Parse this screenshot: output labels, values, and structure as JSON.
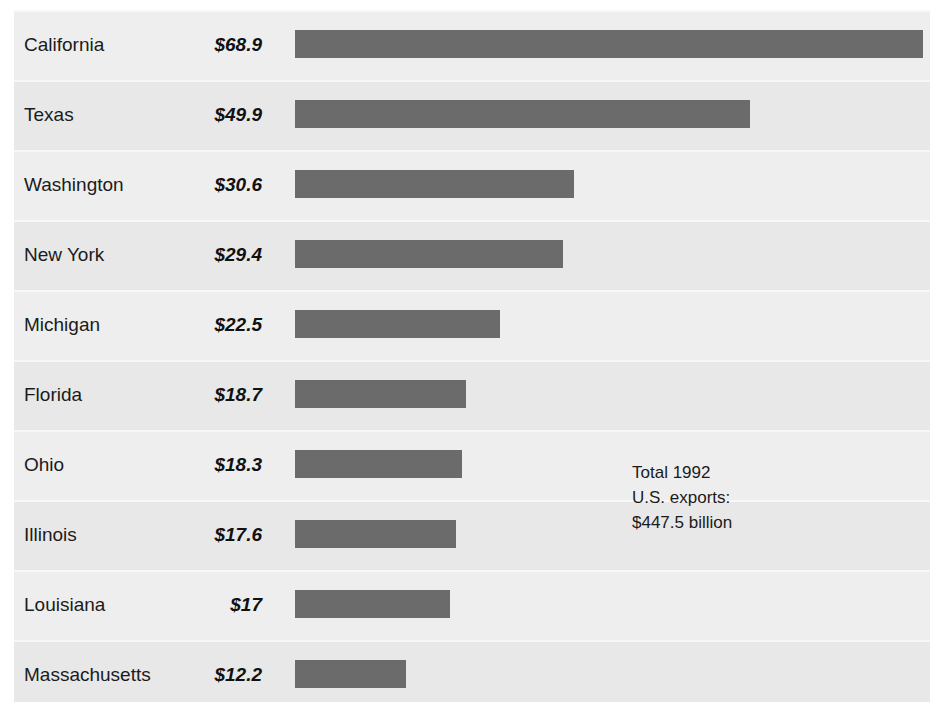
{
  "chart_data": {
    "type": "bar",
    "orientation": "horizontal",
    "title": "",
    "subtitle": "",
    "xlabel": "",
    "ylabel": "",
    "units": "billions of U.S. dollars",
    "grid": false,
    "legend": null,
    "xlim": [
      0,
      68.9
    ],
    "categories": [
      "California",
      "Texas",
      "Washington",
      "New York",
      "Michigan",
      "Florida",
      "Ohio",
      "Illinois",
      "Louisiana",
      "Massachusetts"
    ],
    "values": [
      68.9,
      49.9,
      30.6,
      29.4,
      22.5,
      18.7,
      18.3,
      17.6,
      17,
      12.2
    ],
    "value_labels": [
      "$68.9",
      "$49.9",
      "$30.6",
      "$29.4",
      "$22.5",
      "$18.7",
      "$18.3",
      "$17.6",
      "$17",
      "$12.2"
    ],
    "annotations": [
      {
        "line1": "Total 1992",
        "line2": "U.S. exports:",
        "line3": "$447.5 billion"
      }
    ]
  },
  "rows": [
    {
      "label": "California",
      "value_label": "$68.9",
      "value": 68.9
    },
    {
      "label": "Texas",
      "value_label": "$49.9",
      "value": 49.9
    },
    {
      "label": "Washington",
      "value_label": "$30.6",
      "value": 30.6
    },
    {
      "label": "New York",
      "value_label": "$29.4",
      "value": 29.4
    },
    {
      "label": "Michigan",
      "value_label": "$22.5",
      "value": 22.5
    },
    {
      "label": "Florida",
      "value_label": "$18.7",
      "value": 18.7
    },
    {
      "label": "Ohio",
      "value_label": "$18.3",
      "value": 18.3
    },
    {
      "label": "Illinois",
      "value_label": "$17.6",
      "value": 17.6
    },
    {
      "label": "Louisiana",
      "value_label": "$17",
      "value": 17
    },
    {
      "label": "Massachusetts",
      "value_label": "$12.2",
      "value": 12.2
    }
  ],
  "annotation": {
    "line1": "Total 1992",
    "line2": "U.S. exports:",
    "line3": "$447.5 billion"
  },
  "colors": {
    "bar": "#6b6b6b",
    "panel": "#ececec",
    "band_a": "#eeeeee",
    "band_b": "#e8e8e8",
    "separator": "#f7f7f7",
    "text": "#1b1b1b",
    "page": "#ffffff"
  },
  "layout": {
    "row_height": 70,
    "bar_origin_x": 281,
    "px_per_unit": 9.12,
    "bar_height": 28
  }
}
